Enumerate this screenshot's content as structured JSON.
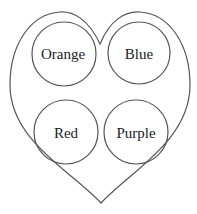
{
  "diagram": {
    "shape": "heart",
    "stroke_color": "#555555",
    "circles": [
      {
        "label": "Orange",
        "cx": 64,
        "cy": 54,
        "r": 32
      },
      {
        "label": "Blue",
        "cx": 139,
        "cy": 53,
        "r": 31
      },
      {
        "label": "Red",
        "cx": 66,
        "cy": 132,
        "r": 32
      },
      {
        "label": "Purple",
        "cx": 136,
        "cy": 132,
        "r": 32
      }
    ]
  }
}
